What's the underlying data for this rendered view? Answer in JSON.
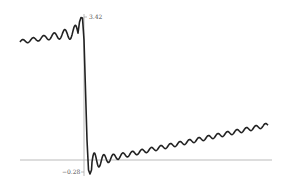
{
  "chart_data": {
    "type": "line",
    "title": "",
    "xlabel": "",
    "ylabel": "",
    "ylim": [
      -0.28,
      3.42
    ],
    "y_ticks": [
      "3.42",
      "-0.28"
    ],
    "x_ticks": [],
    "grid": false,
    "legend": null,
    "series": [
      {
        "name": "f(x)",
        "color": "#222222",
        "x": [
          -2.0,
          -1.6,
          -1.2,
          -0.8,
          -0.4,
          -0.15,
          -0.05,
          0.0,
          0.05,
          0.15,
          0.4,
          0.8,
          1.2,
          1.6,
          2.0,
          2.4,
          2.8,
          3.2,
          3.6,
          4.0,
          4.4,
          4.8,
          5.2,
          5.5
        ],
        "y": [
          2.6,
          2.7,
          2.75,
          2.85,
          2.95,
          3.42,
          3.0,
          1.6,
          0.2,
          -0.28,
          0.2,
          0.25,
          0.35,
          0.45,
          0.55,
          0.65,
          0.75,
          0.85,
          0.95,
          1.05,
          1.15,
          1.25,
          1.3,
          1.35
        ]
      }
    ]
  },
  "labels": {
    "y_max": "3.42",
    "y_min": "−0.28"
  }
}
